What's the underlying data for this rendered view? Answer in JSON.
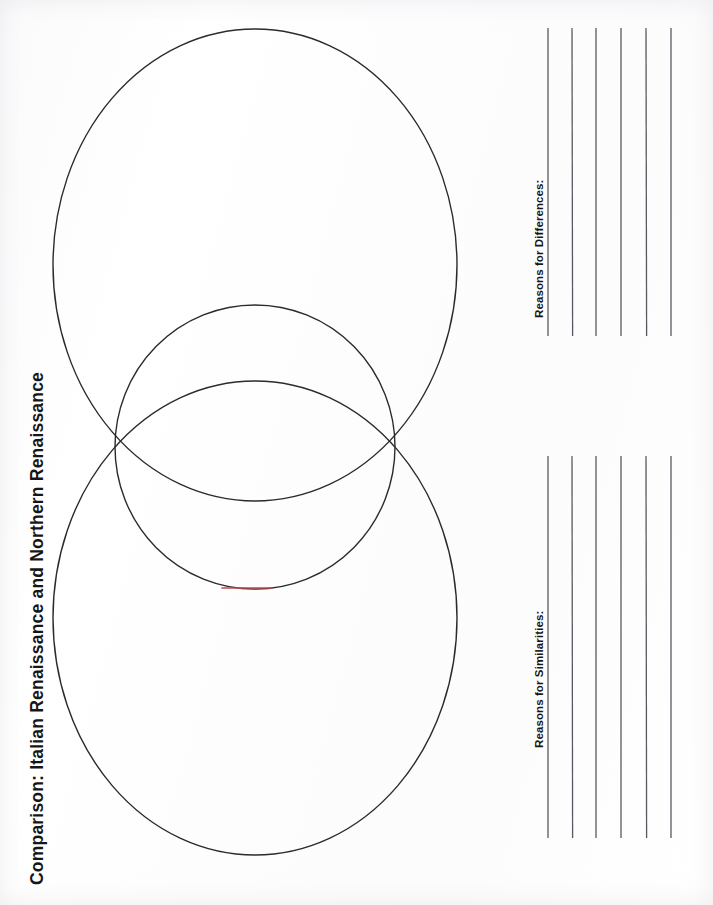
{
  "document": {
    "title": "Comparison: Italian Renaissance and Northern Renaissance",
    "orientation": "rotated-90-ccw",
    "background_color": "#fdfdfd",
    "ink_color": "#2b2b2b",
    "accent_color": "#c0494f"
  },
  "labels": {
    "differences": "Reasons for Differences:",
    "similarities": "Reasons for Similarities:"
  },
  "diagram": {
    "type": "venn-diagram",
    "shape_count": 3,
    "stroke_color": "#2b2b2b",
    "stroke_width": 1.4,
    "fill": "none",
    "shapes": [
      {
        "name": "top-ellipse",
        "cx": 255,
        "cy": 265,
        "rx": 202,
        "ry": 236
      },
      {
        "name": "middle-circle",
        "cx": 255,
        "cy": 447,
        "rx": 140,
        "ry": 142
      },
      {
        "name": "bottom-ellipse",
        "cx": 255,
        "cy": 618,
        "rx": 202,
        "ry": 237
      }
    ],
    "accent_mark": {
      "name": "red-arc-mark",
      "color": "#c0494f",
      "x1": 222,
      "y1": 588,
      "x2": 272,
      "y2": 588
    }
  },
  "writing_lines": {
    "stroke_color": "#555a60",
    "stroke_width": 1.3,
    "groups": [
      {
        "name": "differences-lines",
        "y_top": 28,
        "y_bottom": 336,
        "x_positions": [
          548,
          572,
          596,
          621,
          646,
          671
        ]
      },
      {
        "name": "similarities-lines",
        "y_top": 456,
        "y_bottom": 838,
        "x_positions": [
          548,
          572,
          596,
          621,
          646,
          671
        ]
      }
    ]
  }
}
